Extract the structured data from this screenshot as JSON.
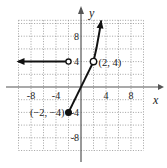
{
  "chart_data": {
    "type": "line",
    "title": "",
    "xlabel": "x",
    "ylabel": "y",
    "xlim": [
      -10,
      10
    ],
    "ylim": [
      -10,
      10.5
    ],
    "grid": true,
    "grid_step": 2,
    "xticks": [
      -8,
      -4,
      4,
      8
    ],
    "yticks": [
      8,
      4,
      -4,
      -8
    ],
    "xtick_labels": [
      "-8",
      "-4",
      "4",
      "8"
    ],
    "ytick_labels": [
      "8",
      "4",
      "-4",
      "-8"
    ],
    "series": [
      {
        "name": "piece-1",
        "rule": "y = 4",
        "domain": "x < -2",
        "points": [
          [
            -10,
            4
          ],
          [
            -2,
            4
          ]
        ],
        "left_arrow": true,
        "right_endpoint": "open"
      },
      {
        "name": "piece-2",
        "rule": "y = 2x",
        "domain": "-2 <= x <= 2",
        "points": [
          [
            -2,
            -4
          ],
          [
            2,
            4
          ]
        ],
        "left_endpoint": "closed"
      },
      {
        "name": "piece-3",
        "rule": "y = x^2",
        "domain": "x > 2",
        "points": [
          [
            2,
            4
          ],
          [
            2.5,
            6.25
          ],
          [
            3,
            9
          ],
          [
            3.24,
            10.5
          ]
        ],
        "left_endpoint": "open",
        "right_arrow": true
      }
    ],
    "annotations": [
      {
        "text": "(2, 4)",
        "at": [
          2,
          4
        ]
      },
      {
        "text": "(−2, −4)",
        "at": [
          -2,
          -4
        ]
      }
    ]
  }
}
